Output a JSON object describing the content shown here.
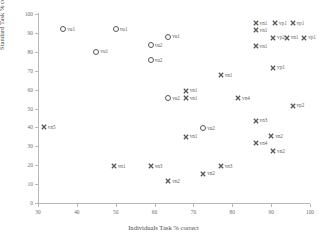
{
  "chart_data": {
    "type": "scatter",
    "title": "",
    "xlabel": "Individuals Task % correct",
    "ylabel": "Standard Task % correct",
    "xlim": [
      30,
      100
    ],
    "ylim": [
      0,
      100
    ],
    "xticks": [
      30,
      40,
      50,
      60,
      70,
      80,
      90,
      100
    ],
    "yticks": [
      0,
      10,
      20,
      30,
      40,
      50,
      60,
      70,
      80,
      90,
      100
    ],
    "grid": false,
    "legend": "none",
    "marker_types": {
      "circle": "open-circle",
      "cross": "x-cross"
    },
    "points": [
      {
        "label": "vu1",
        "x": 36.5,
        "y": 92,
        "marker": "circle"
      },
      {
        "label": "vu1",
        "x": 50.0,
        "y": 92,
        "marker": "circle"
      },
      {
        "label": "vu1",
        "x": 63.5,
        "y": 88,
        "marker": "circle"
      },
      {
        "label": "vu1",
        "x": 45.0,
        "y": 80,
        "marker": "circle"
      },
      {
        "label": "vu2",
        "x": 59.0,
        "y": 83.5,
        "marker": "circle"
      },
      {
        "label": "vu2",
        "x": 59.0,
        "y": 75.5,
        "marker": "circle"
      },
      {
        "label": "vu2",
        "x": 63.5,
        "y": 55.5,
        "marker": "circle"
      },
      {
        "label": "vu2",
        "x": 72.5,
        "y": 39.5,
        "marker": "circle"
      },
      {
        "label": "vn1",
        "x": 86.0,
        "y": 95,
        "marker": "cross"
      },
      {
        "label": "vp1",
        "x": 91.0,
        "y": 95,
        "marker": "cross"
      },
      {
        "label": "vp1",
        "x": 95.5,
        "y": 95,
        "marker": "cross"
      },
      {
        "label": "vn1",
        "x": 86.0,
        "y": 91.5,
        "marker": "cross"
      },
      {
        "label": "vp2",
        "x": 90.5,
        "y": 87.5,
        "marker": "cross"
      },
      {
        "label": "vn1",
        "x": 94.0,
        "y": 87.5,
        "marker": "cross"
      },
      {
        "label": "vp1",
        "x": 98.5,
        "y": 87.5,
        "marker": "cross"
      },
      {
        "label": "vn1",
        "x": 86.0,
        "y": 83,
        "marker": "cross"
      },
      {
        "label": "vp1",
        "x": 90.5,
        "y": 71.5,
        "marker": "cross"
      },
      {
        "label": "vn1",
        "x": 77.0,
        "y": 67.5,
        "marker": "cross"
      },
      {
        "label": "vn1",
        "x": 68.0,
        "y": 59.5,
        "marker": "cross"
      },
      {
        "label": "vn1",
        "x": 68.0,
        "y": 55.5,
        "marker": "cross"
      },
      {
        "label": "vn4",
        "x": 81.5,
        "y": 55.5,
        "marker": "cross"
      },
      {
        "label": "vp2",
        "x": 95.5,
        "y": 51.5,
        "marker": "cross"
      },
      {
        "label": "vn3",
        "x": 86.0,
        "y": 43.5,
        "marker": "cross"
      },
      {
        "label": "vn5",
        "x": 31.5,
        "y": 40,
        "marker": "cross"
      },
      {
        "label": "vn2",
        "x": 90.0,
        "y": 35.5,
        "marker": "cross"
      },
      {
        "label": "vn1",
        "x": 68.0,
        "y": 35,
        "marker": "cross"
      },
      {
        "label": "vn4",
        "x": 86.0,
        "y": 31.5,
        "marker": "cross"
      },
      {
        "label": "vn2",
        "x": 90.5,
        "y": 27.5,
        "marker": "cross"
      },
      {
        "label": "vn1",
        "x": 49.5,
        "y": 19.5,
        "marker": "cross"
      },
      {
        "label": "vn3",
        "x": 59.0,
        "y": 19.5,
        "marker": "cross"
      },
      {
        "label": "vn3",
        "x": 77.0,
        "y": 19.5,
        "marker": "cross"
      },
      {
        "label": "vn2",
        "x": 72.5,
        "y": 15.5,
        "marker": "cross"
      },
      {
        "label": "vn2",
        "x": 63.5,
        "y": 11.5,
        "marker": "cross"
      }
    ]
  },
  "colors": {
    "axis": "#b9b9b9",
    "marker": "#58585a",
    "label_text": "#5d5d5f",
    "tick_text": "#6d6d6d",
    "title_text": "#4a4a4a",
    "background": "#ffffff"
  }
}
